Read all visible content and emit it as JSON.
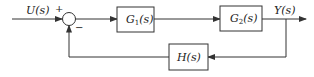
{
  "diagram": {
    "type": "feedback-control-block-diagram",
    "colors": {
      "line": "#333333",
      "background": "#ffffff",
      "text": "#222222"
    },
    "input": {
      "label": "U(s)"
    },
    "output": {
      "label": "Y(s)"
    },
    "summing_junction": {
      "plus_sign": "+",
      "minus_sign": "−"
    },
    "blocks": {
      "g1": {
        "label_main": "G",
        "label_sub": "1",
        "label_arg": "(s)"
      },
      "g2": {
        "label_main": "G",
        "label_sub": "2",
        "label_arg": "(s)"
      },
      "h": {
        "label": "H(s)"
      }
    }
  }
}
